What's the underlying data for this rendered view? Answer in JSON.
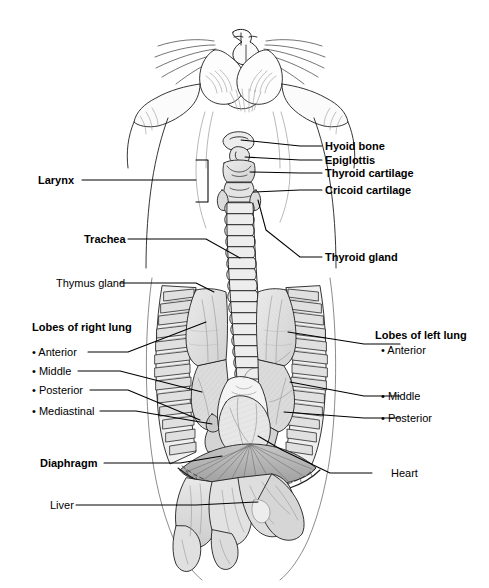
{
  "figure": {
    "background_color": "#ffffff",
    "line_color": "#1a1a1a",
    "shade_light": "#e3e3e3",
    "shade_mid": "#cfcfcf",
    "shade_dark": "#b0b0b0"
  },
  "labels": {
    "right_upper": [
      {
        "id": "hyoid-bone",
        "text": "Hyoid bone",
        "bold": true
      },
      {
        "id": "epiglottis",
        "text": "Epiglottis",
        "bold": true
      },
      {
        "id": "thyroid-cartilage",
        "text": "Thyroid cartilage",
        "bold": true
      },
      {
        "id": "cricoid-cartilage",
        "text": "Cricoid cartilage",
        "bold": true
      },
      {
        "id": "thyroid-gland",
        "text": "Thyroid gland",
        "bold": true
      }
    ],
    "left_upper": [
      {
        "id": "larynx",
        "text": "Larynx",
        "bold": true
      },
      {
        "id": "trachea",
        "text": "Trachea",
        "bold": true
      },
      {
        "id": "thymus-gland",
        "text": "Thymus gland",
        "bold": false
      }
    ],
    "left_lung_group": {
      "heading": "Lobes of right lung",
      "heading_bold": true,
      "items": [
        {
          "id": "right-lobe-anterior",
          "text": "• Anterior"
        },
        {
          "id": "right-lobe-middle",
          "text": "• Middle"
        },
        {
          "id": "right-lobe-posterior",
          "text": "• Posterior"
        },
        {
          "id": "right-lobe-mediastinal",
          "text": "• Mediastinal"
        }
      ]
    },
    "right_lung_group": {
      "heading": "Lobes of left lung",
      "heading_bold": true,
      "items": [
        {
          "id": "left-lobe-anterior",
          "text": "• Anterior"
        },
        {
          "id": "left-lobe-middle",
          "text": "• Middle"
        },
        {
          "id": "left-lobe-posterior",
          "text": "• Posterior"
        }
      ]
    },
    "lower": [
      {
        "id": "diaphragm",
        "text": "Diaphragm",
        "bold": true
      },
      {
        "id": "liver",
        "text": "Liver",
        "bold": false
      },
      {
        "id": "heart",
        "text": "Heart",
        "bold": false
      }
    ]
  }
}
